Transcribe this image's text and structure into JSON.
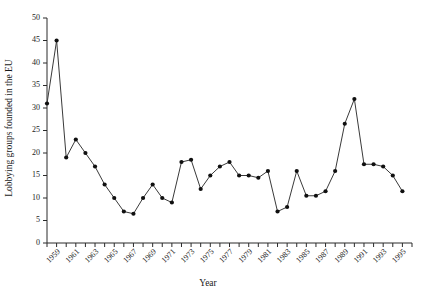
{
  "chart_data": {
    "type": "line",
    "title": "",
    "xlabel": "Year",
    "ylabel": "Lobbying groups founded in the EU",
    "xlim": [
      1958,
      1996
    ],
    "ylim": [
      0,
      50
    ],
    "grid": false,
    "legend": null,
    "ytick_labels": [
      "0",
      "5",
      "10",
      "15",
      "20",
      "25",
      "30",
      "35",
      "40",
      "45",
      "50"
    ],
    "ytick_values": [
      0,
      5,
      10,
      15,
      20,
      25,
      30,
      35,
      40,
      45,
      50
    ],
    "xtick_labels": [
      "1959",
      "1961",
      "1963",
      "1965",
      "1967",
      "1969",
      "1971",
      "1973",
      "1975",
      "1977",
      "1979",
      "1981",
      "1983",
      "1985",
      "1987",
      "1989",
      "1991",
      "1993",
      "1995"
    ],
    "xtick_values": [
      1959,
      1961,
      1963,
      1965,
      1967,
      1969,
      1971,
      1973,
      1975,
      1977,
      1979,
      1981,
      1983,
      1985,
      1987,
      1989,
      1991,
      1993,
      1995
    ],
    "x": [
      1958,
      1959,
      1960,
      1961,
      1962,
      1963,
      1964,
      1965,
      1966,
      1967,
      1968,
      1969,
      1970,
      1971,
      1972,
      1973,
      1974,
      1975,
      1976,
      1977,
      1978,
      1979,
      1980,
      1981,
      1982,
      1983,
      1984,
      1985,
      1986,
      1987,
      1988,
      1989,
      1990,
      1991,
      1992,
      1993,
      1994,
      1995
    ],
    "values": [
      31,
      45,
      19,
      23,
      20,
      17,
      13,
      10,
      7,
      6.5,
      10,
      13,
      10,
      9,
      18,
      18.5,
      12,
      15,
      17,
      18,
      15,
      15,
      14.5,
      16,
      7,
      8,
      16,
      10.5,
      10.5,
      11.5,
      16,
      26.5,
      32,
      17.5,
      17.5,
      17,
      15,
      11.5
    ],
    "series": [
      {
        "name": "Lobbying groups founded in the EU",
        "values": [
          31,
          45,
          19,
          23,
          20,
          17,
          13,
          10,
          7,
          6.5,
          10,
          13,
          10,
          9,
          18,
          18.5,
          12,
          15,
          17,
          18,
          15,
          15,
          14.5,
          16,
          7,
          8,
          16,
          10.5,
          10.5,
          11.5,
          16,
          26.5,
          32,
          17.5,
          17.5,
          17,
          15,
          11.5
        ],
        "color": "#101010",
        "marker": "filled-circle"
      }
    ],
    "colors": {
      "line": "#3a3a3a",
      "marker": "#101010",
      "axis": "#2b2b2b",
      "background": "#ffffff"
    }
  }
}
